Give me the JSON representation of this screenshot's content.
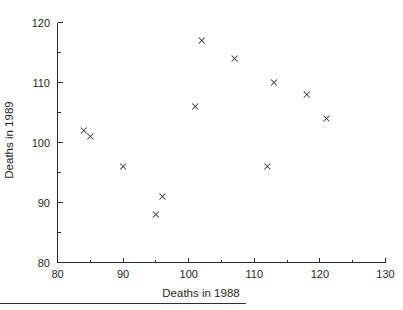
{
  "chart_data": {
    "type": "scatter",
    "title": "",
    "subtitle": "",
    "xlabel": "Deaths in 1988",
    "ylabel": "Deaths in 1989",
    "xlim": [
      80,
      130
    ],
    "ylim": [
      80,
      120
    ],
    "x_major_ticks": [
      80,
      90,
      100,
      110,
      120,
      130
    ],
    "y_major_ticks": [
      80,
      90,
      100,
      110,
      120
    ],
    "x_minor_ticks": [
      85,
      95,
      105,
      115,
      125
    ],
    "y_minor_ticks": [
      85,
      95,
      105,
      115
    ],
    "x_tick_labels": [
      "80",
      "90",
      "100",
      "110",
      "120",
      "130"
    ],
    "y_tick_labels": [
      "80",
      "90",
      "100",
      "110",
      "120"
    ],
    "grid": false,
    "legend": false,
    "legend_position": "none",
    "marker_style": "x",
    "marker_color": "#3a3a3a",
    "n_points": 12,
    "x": [
      84,
      85,
      90,
      95,
      96,
      101,
      102,
      107,
      112,
      113,
      118,
      121
    ],
    "y": [
      102,
      101,
      96,
      88,
      91,
      106,
      117,
      114,
      96,
      110,
      108,
      104
    ],
    "points": [
      {
        "x": 84,
        "y": 102
      },
      {
        "x": 85,
        "y": 101
      },
      {
        "x": 90,
        "y": 96
      },
      {
        "x": 95,
        "y": 88
      },
      {
        "x": 96,
        "y": 91
      },
      {
        "x": 101,
        "y": 106
      },
      {
        "x": 102,
        "y": 117
      },
      {
        "x": 107,
        "y": 114
      },
      {
        "x": 112,
        "y": 96
      },
      {
        "x": 113,
        "y": 110
      },
      {
        "x": 118,
        "y": 108
      },
      {
        "x": 121,
        "y": 104
      }
    ]
  },
  "figure": {
    "background_color": "#ffffff",
    "axis_color": "#2b2b2b",
    "text_color": "#1f1f1f"
  }
}
